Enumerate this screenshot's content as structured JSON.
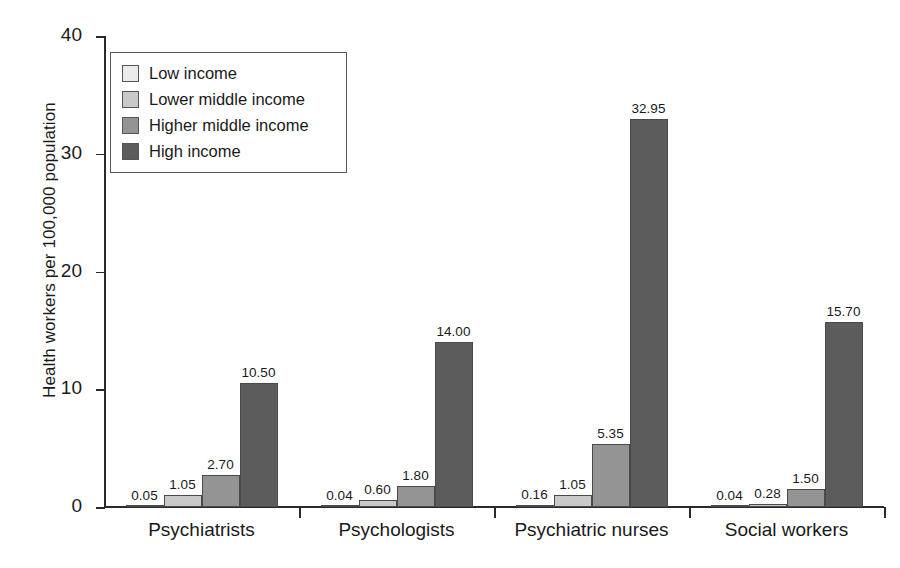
{
  "chart_data": {
    "type": "bar",
    "title": "",
    "xlabel": "",
    "ylabel": "Health workers per 100,000 population",
    "ylim": [
      0,
      40
    ],
    "yticks": [
      0,
      10,
      20,
      30,
      40
    ],
    "ytick_labels": [
      "0",
      "10",
      "20",
      "30",
      "40"
    ],
    "grid": false,
    "legend_position": "upper left",
    "categories": [
      "Psychiatrists",
      "Psychologists",
      "Psychiatric nurses",
      "Social workers"
    ],
    "series": [
      {
        "name": "Low income",
        "color": "#ebebeb",
        "values": [
          0.05,
          0.04,
          0.16,
          0.04
        ],
        "labels": [
          "0.05",
          "0.04",
          "0.16",
          "0.04"
        ]
      },
      {
        "name": "Lower middle income",
        "color": "#c9c9c9",
        "values": [
          1.05,
          0.6,
          1.05,
          0.28
        ],
        "labels": [
          "1.05",
          "0.60",
          "1.05",
          "0.28"
        ]
      },
      {
        "name": "Higher middle income",
        "color": "#949494",
        "values": [
          2.7,
          1.8,
          5.35,
          1.5
        ],
        "labels": [
          "2.70",
          "1.80",
          "5.35",
          "1.50"
        ]
      },
      {
        "name": "High income",
        "color": "#5c5c5c",
        "values": [
          10.5,
          14.0,
          32.95,
          15.7
        ],
        "labels": [
          "10.50",
          "14.00",
          "32.95",
          "15.70"
        ]
      }
    ]
  },
  "axes": {
    "y_title": "Health workers per 100,000 population"
  }
}
